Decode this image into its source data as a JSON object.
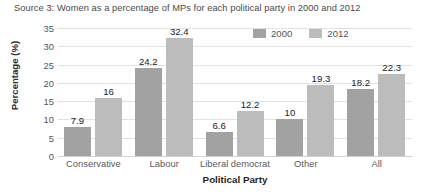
{
  "source_caption": "Source 3: Women as a percentage of MPs for each political party in 2000 and 2012",
  "axis": {
    "x_title": "Political Party",
    "y_title": "Percentage (%)"
  },
  "legend": {
    "entries": [
      {
        "label": "2000",
        "color": "#a2a2a2"
      },
      {
        "label": "2012",
        "color": "#bcbcbc"
      }
    ]
  },
  "ticks": {
    "y": [
      "0",
      "5",
      "10",
      "15",
      "20",
      "25",
      "30",
      "35"
    ],
    "x": [
      "Conservative",
      "Labour",
      "Liberal democrat",
      "Other",
      "All"
    ]
  },
  "labels": {
    "series_2000": [
      "7.9",
      "24.2",
      "6.6",
      "10",
      "18.2"
    ],
    "series_2012": [
      "16",
      "32.4",
      "12.2",
      "19.3",
      "22.3"
    ]
  },
  "chart_data": {
    "type": "bar",
    "title": "Source 3: Women as a percentage of MPs for each political party in 2000 and 2012",
    "subtitle": "",
    "xlabel": "Political Party",
    "ylabel": "Percentage (%)",
    "categories": [
      "Conservative",
      "Labour",
      "Liberal democrat",
      "Other",
      "All"
    ],
    "series": [
      {
        "name": "2000",
        "color": "#a2a2a2",
        "values": [
          7.9,
          24.2,
          6.6,
          10,
          18.2
        ]
      },
      {
        "name": "2012",
        "color": "#bcbcbc",
        "values": [
          16,
          32.4,
          12.2,
          19.3,
          22.3
        ]
      }
    ],
    "ylim": [
      0,
      35
    ],
    "ytick_step": 5,
    "yticks": [
      0,
      5,
      10,
      15,
      20,
      25,
      30,
      35
    ],
    "grid": "horizontal",
    "legend_position": "top-right",
    "data_labels": true
  }
}
